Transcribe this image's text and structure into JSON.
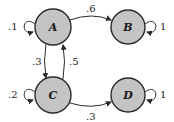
{
  "diagram": {
    "type": "markov-chain-state-diagram",
    "colors": {
      "node_fill": "#c4c4c4",
      "node_stroke": "#2a2a2a",
      "edge": "#2a2a2a",
      "text": "#1a1a1a"
    },
    "nodes": [
      {
        "id": "A",
        "label": "A"
      },
      {
        "id": "B",
        "label": "B"
      },
      {
        "id": "C",
        "label": "C"
      },
      {
        "id": "D",
        "label": "D"
      }
    ],
    "edges": [
      {
        "from": "A",
        "to": "A",
        "label": ".1"
      },
      {
        "from": "A",
        "to": "B",
        "label": ".6"
      },
      {
        "from": "A",
        "to": "C",
        "label": ".3"
      },
      {
        "from": "B",
        "to": "B",
        "label": "1"
      },
      {
        "from": "C",
        "to": "A",
        "label": ".5"
      },
      {
        "from": "C",
        "to": "C",
        "label": ".2"
      },
      {
        "from": "C",
        "to": "D",
        "label": ".3"
      },
      {
        "from": "D",
        "to": "D",
        "label": "1"
      }
    ]
  }
}
